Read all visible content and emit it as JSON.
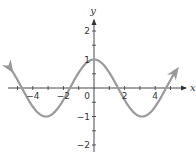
{
  "chart_data": {
    "type": "line",
    "title": "",
    "function": "y = cos x",
    "xlabel": "x",
    "ylabel": "y",
    "xlim": [
      -5.4,
      5.4
    ],
    "ylim": [
      -2.2,
      2.6
    ],
    "x_ticks": [
      -5,
      -4,
      -3,
      -2,
      -1,
      1,
      2,
      3,
      4,
      5
    ],
    "x_tick_labels": [
      {
        "value": -4,
        "label": "−4"
      },
      {
        "value": -2,
        "label": "−2"
      },
      {
        "value": 2,
        "label": "2"
      },
      {
        "value": 4,
        "label": "4"
      }
    ],
    "y_ticks": [
      -2,
      -1.5,
      -1,
      -0.5,
      0.5,
      1,
      1.5,
      2
    ],
    "y_tick_labels": [
      {
        "value": 2,
        "label": "2"
      },
      {
        "value": 1,
        "label": "1"
      },
      {
        "value": -1,
        "label": "−1"
      },
      {
        "value": -2,
        "label": "−2"
      }
    ],
    "origin_label": "0",
    "grid": false,
    "legend": null,
    "series": [
      {
        "name": "cos x",
        "color": "#9a9a9a",
        "arrows_at_ends": true,
        "x": [
          -5.4,
          -4.71,
          -3.14,
          -1.57,
          0,
          1.57,
          3.14,
          4.71,
          5.4
        ],
        "y": [
          0.63,
          0,
          -1,
          0,
          1,
          0,
          -1,
          0,
          0.63
        ]
      }
    ],
    "axis_color": "#333333"
  }
}
